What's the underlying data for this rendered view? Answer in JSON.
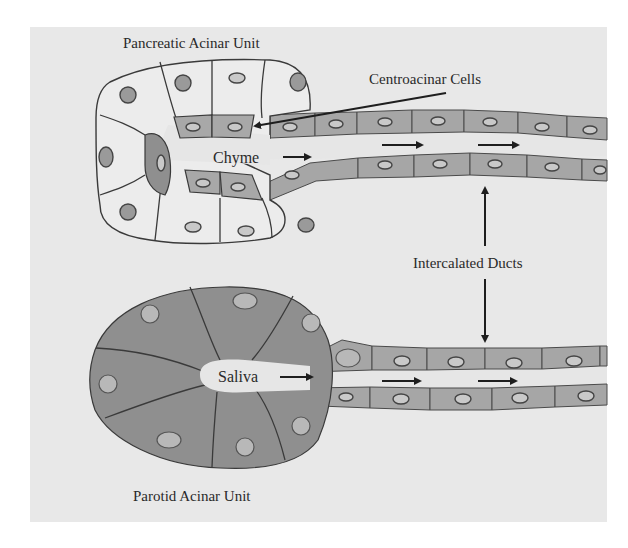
{
  "diagram": {
    "title_top": "Pancreatic Acinar Unit",
    "title_bottom": "Parotid Acinar Unit",
    "labels": {
      "centroacinar": "Centroacinar Cells",
      "chyme": "Chyme",
      "saliva": "Saliva",
      "intercalated": "Intercalated Ducts"
    },
    "colors": {
      "background": "#e8e8e8",
      "light_cell": "#ececec",
      "dark_cell": "#8f8f8f",
      "duct_cell": "#a6a6a6",
      "outline": "#3a3a3a"
    },
    "elements": [
      {
        "id": "pancreatic-acinus",
        "type": "cell-cluster",
        "cells": "pale acinar cells with centroacinar cells lining lumen"
      },
      {
        "id": "pancreatic-duct",
        "type": "duct",
        "flow": "left-to-right",
        "arrows": 3
      },
      {
        "id": "parotid-acinus",
        "type": "cell-cluster",
        "cells": "dark acinar cells radiating around lumen"
      },
      {
        "id": "parotid-duct",
        "type": "duct",
        "flow": "left-to-right",
        "arrows": 3
      }
    ],
    "connectors": [
      {
        "from": "Centroacinar Cells",
        "to": "centroacinar cell in pancreatic lumen"
      },
      {
        "from": "Intercalated Ducts",
        "to": "pancreatic-duct",
        "direction": "up"
      },
      {
        "from": "Intercalated Ducts",
        "to": "parotid-duct",
        "direction": "down"
      }
    ]
  }
}
